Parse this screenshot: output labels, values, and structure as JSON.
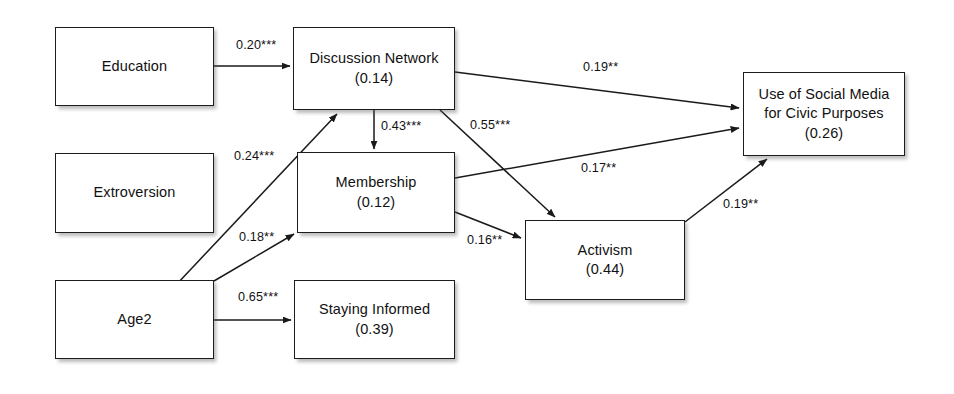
{
  "figure": {
    "type": "path-diagram",
    "background_color": "#ffffff",
    "line_color": "#1a1a1a",
    "box_border_color": "#1c1c1c",
    "box_fill_color": "#ffffff"
  },
  "nodes": [
    {
      "id": "education",
      "label": "Education",
      "value": "",
      "x": 55,
      "y": 27,
      "w": 159,
      "h": 79
    },
    {
      "id": "extroversion",
      "label": "Extroversion",
      "value": "",
      "x": 55,
      "y": 153,
      "w": 159,
      "h": 80
    },
    {
      "id": "age2",
      "label": "Age2",
      "value": "",
      "x": 55,
      "y": 280,
      "w": 159,
      "h": 79
    },
    {
      "id": "discussion-network",
      "label": "Discussion Network",
      "value": "(0.14)",
      "x": 293,
      "y": 27,
      "w": 162,
      "h": 83
    },
    {
      "id": "membership",
      "label": "Membership",
      "value": "(0.12)",
      "x": 297,
      "y": 152,
      "w": 158,
      "h": 81
    },
    {
      "id": "staying-informed",
      "label": "Staying Informed",
      "value": "(0.39)",
      "x": 294,
      "y": 280,
      "w": 161,
      "h": 79
    },
    {
      "id": "activism",
      "label": "Activism",
      "value": "(0.44)",
      "x": 525,
      "y": 220,
      "w": 160,
      "h": 80
    },
    {
      "id": "use-of-social-media",
      "label": "Use of Social Media\nfor Civic Purposes",
      "label_line1": "Use of Social Media",
      "label_line2": "for Civic Purposes",
      "value": "(0.26)",
      "x": 743,
      "y": 72,
      "w": 162,
      "h": 84
    }
  ],
  "edges": [
    {
      "id": "education-to-discussion-network",
      "from": "education",
      "to": "discussion-network",
      "coefficient": "0.20***",
      "label_x": 236,
      "label_y": 38
    },
    {
      "id": "extroversion-to-discussion-network",
      "from": "extroversion",
      "to": "discussion-network",
      "coefficient": "0.24***",
      "label_x": 234,
      "label_y": 149
    },
    {
      "id": "age2-to-membership",
      "from": "age2",
      "to": "membership",
      "coefficient": "0.18**",
      "label_x": 239,
      "label_y": 230
    },
    {
      "id": "age2-to-staying-informed",
      "from": "age2",
      "to": "staying-informed",
      "coefficient": "0.65***",
      "label_x": 238,
      "label_y": 290
    },
    {
      "id": "discussion-network-to-membership",
      "from": "discussion-network",
      "to": "membership",
      "coefficient": "0.43***",
      "label_x": 381,
      "label_y": 119
    },
    {
      "id": "discussion-network-to-activism",
      "from": "discussion-network",
      "to": "activism",
      "coefficient": "0.55***",
      "label_x": 470,
      "label_y": 118
    },
    {
      "id": "discussion-network-to-use-of-social-media",
      "from": "discussion-network",
      "to": "use-of-social-media",
      "coefficient": "0.19**",
      "label_x": 583,
      "label_y": 60
    },
    {
      "id": "membership-to-use-of-social-media",
      "from": "membership",
      "to": "use-of-social-media",
      "coefficient": "0.17**",
      "label_x": 581,
      "label_y": 161
    },
    {
      "id": "membership-to-activism",
      "from": "membership",
      "to": "activism",
      "coefficient": "0.16**",
      "label_x": 467,
      "label_y": 233
    },
    {
      "id": "activism-to-use-of-social-media",
      "from": "activism",
      "to": "use-of-social-media",
      "coefficient": "0.19**",
      "label_x": 723,
      "label_y": 197
    }
  ]
}
